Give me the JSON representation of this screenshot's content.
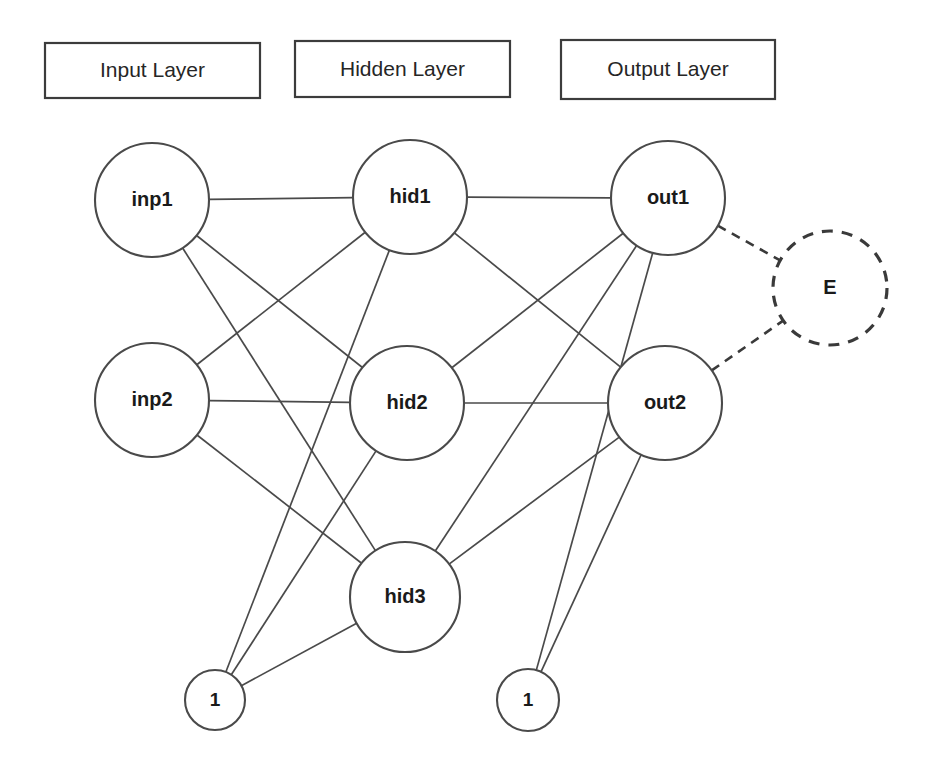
{
  "diagram": {
    "background_color": "#ffffff",
    "edge_color": "#4a4a4a",
    "node_stroke_color": "#4a4a4a",
    "node_fill_color": "#ffffff",
    "label_color": "#1a1a1a",
    "width": 931,
    "height": 774
  },
  "layer_boxes": [
    {
      "id": "input-layer-box",
      "label": "Input Layer",
      "x": 45,
      "y": 43,
      "w": 215,
      "h": 55
    },
    {
      "id": "hidden-layer-box",
      "label": "Hidden Layer",
      "x": 295,
      "y": 41,
      "w": 215,
      "h": 56
    },
    {
      "id": "output-layer-box",
      "label": "Output Layer",
      "x": 561,
      "y": 40,
      "w": 214,
      "h": 59
    }
  ],
  "nodes": [
    {
      "id": "inp1",
      "label": "inp1",
      "layer": "input",
      "cx": 152,
      "cy": 200,
      "r": 57,
      "style": "solid"
    },
    {
      "id": "inp2",
      "label": "inp2",
      "layer": "input",
      "cx": 152,
      "cy": 400,
      "r": 57,
      "style": "solid"
    },
    {
      "id": "hid1",
      "label": "hid1",
      "layer": "hidden",
      "cx": 410,
      "cy": 197,
      "r": 57,
      "style": "solid"
    },
    {
      "id": "hid2",
      "label": "hid2",
      "layer": "hidden",
      "cx": 407,
      "cy": 403,
      "r": 57,
      "style": "solid"
    },
    {
      "id": "hid3",
      "label": "hid3",
      "layer": "hidden",
      "cx": 405,
      "cy": 597,
      "r": 55,
      "style": "solid"
    },
    {
      "id": "out1",
      "label": "out1",
      "layer": "output",
      "cx": 668,
      "cy": 198,
      "r": 57,
      "style": "solid"
    },
    {
      "id": "out2",
      "label": "out2",
      "layer": "output",
      "cx": 665,
      "cy": 403,
      "r": 57,
      "style": "solid"
    },
    {
      "id": "error",
      "label": "E",
      "layer": "error",
      "cx": 830,
      "cy": 288,
      "r": 57,
      "style": "dashed"
    },
    {
      "id": "bias1",
      "label": "1",
      "layer": "bias",
      "cx": 215,
      "cy": 700,
      "r": 30,
      "style": "solid"
    },
    {
      "id": "bias2",
      "label": "1",
      "layer": "bias",
      "cx": 528,
      "cy": 700,
      "r": 31,
      "style": "solid"
    }
  ],
  "edges": [
    {
      "from": "inp1",
      "to": "hid1",
      "style": "solid"
    },
    {
      "from": "inp1",
      "to": "hid2",
      "style": "solid"
    },
    {
      "from": "inp1",
      "to": "hid3",
      "style": "solid"
    },
    {
      "from": "inp2",
      "to": "hid1",
      "style": "solid"
    },
    {
      "from": "inp2",
      "to": "hid2",
      "style": "solid"
    },
    {
      "from": "inp2",
      "to": "hid3",
      "style": "solid"
    },
    {
      "from": "bias1",
      "to": "hid1",
      "style": "solid"
    },
    {
      "from": "bias1",
      "to": "hid2",
      "style": "solid"
    },
    {
      "from": "bias1",
      "to": "hid3",
      "style": "solid"
    },
    {
      "from": "hid1",
      "to": "out1",
      "style": "solid"
    },
    {
      "from": "hid1",
      "to": "out2",
      "style": "solid"
    },
    {
      "from": "hid2",
      "to": "out1",
      "style": "solid"
    },
    {
      "from": "hid2",
      "to": "out2",
      "style": "solid"
    },
    {
      "from": "hid3",
      "to": "out1",
      "style": "solid"
    },
    {
      "from": "hid3",
      "to": "out2",
      "style": "solid"
    },
    {
      "from": "bias2",
      "to": "out1",
      "style": "solid"
    },
    {
      "from": "bias2",
      "to": "out2",
      "style": "solid"
    },
    {
      "from": "out1",
      "to": "error",
      "style": "dashed"
    },
    {
      "from": "out2",
      "to": "error",
      "style": "dashed"
    }
  ]
}
